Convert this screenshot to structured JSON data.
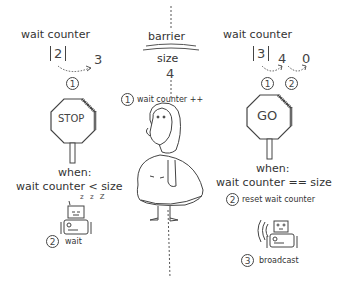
{
  "center": {
    "title": "barrier",
    "size_label": "size",
    "size_value": "4",
    "step1": {
      "num": "1",
      "label": "wait counter ++"
    }
  },
  "left": {
    "title": "wait counter",
    "current_value": "2",
    "next_value": "3",
    "step_marker": "1",
    "sign_text": "STOP",
    "condition_when": "when:",
    "condition": "wait counter < size",
    "sleep_glyphs": "z z Z",
    "step2": {
      "num": "2",
      "label": "wait"
    }
  },
  "right": {
    "title": "wait counter",
    "current_value": "3",
    "next_value": "4",
    "reset_value": "0",
    "step_markers": [
      "1",
      "2"
    ],
    "sign_text": "GO",
    "condition_when": "when:",
    "condition": "wait counter == size",
    "step2": {
      "num": "2",
      "label": "reset wait counter"
    },
    "step3": {
      "num": "3",
      "label": "broadcast"
    }
  }
}
